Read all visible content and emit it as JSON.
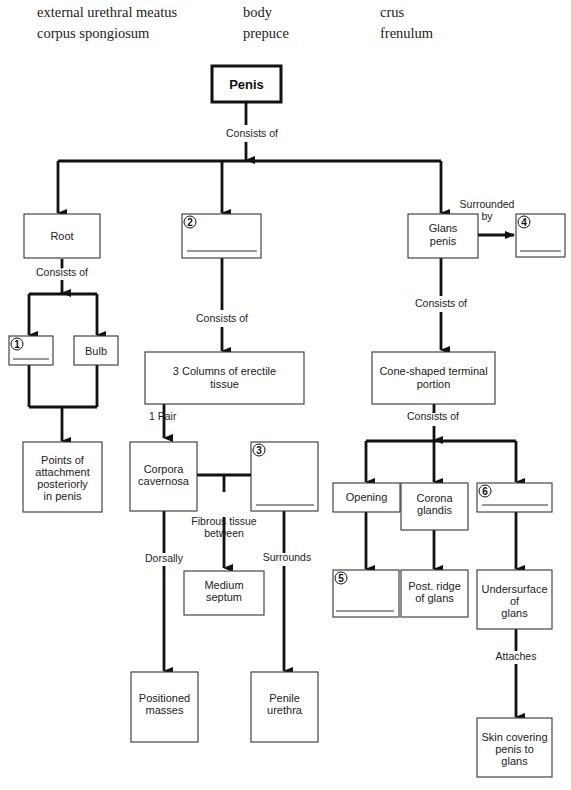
{
  "word_bank": [
    {
      "text": "external urethral meatus",
      "x": 37,
      "y": 6
    },
    {
      "text": "body",
      "x": 243,
      "y": 6
    },
    {
      "text": "crus",
      "x": 380,
      "y": 6
    },
    {
      "text": "corpus spongiosum",
      "x": 37,
      "y": 28
    },
    {
      "text": "prepuce",
      "x": 243,
      "y": 28
    },
    {
      "text": "frenulum",
      "x": 380,
      "y": 28
    }
  ],
  "diagram": {
    "title": "Penis",
    "nodes": {
      "root": "Root",
      "blank2": "",
      "glans": [
        "Glans",
        "penis"
      ],
      "blank4": "",
      "blank1": "",
      "bulb": "Bulb",
      "attachment": [
        "Points of",
        "attachment",
        "posteriorly",
        "in penis"
      ],
      "columns": [
        "3 Columns of erectile",
        "tissue"
      ],
      "cone": [
        "Cone-shaped terminal",
        "portion"
      ],
      "corpora": [
        "Corpora",
        "cavernosa"
      ],
      "blank3": "",
      "septum": [
        "Medium",
        "septum"
      ],
      "positioned": [
        "Positioned",
        "masses"
      ],
      "urethra": [
        "Penile",
        "urethra"
      ],
      "opening": "Opening",
      "corona": [
        "Corona",
        "glandis"
      ],
      "blank6": "",
      "blank5": "",
      "postridge": [
        "Post. ridge",
        "of glans"
      ],
      "undersurface": [
        "Undersurface",
        "of",
        "glans"
      ],
      "skin": [
        "Skin covering",
        "penis to",
        "glans"
      ]
    },
    "numbers": [
      "1",
      "2",
      "3",
      "4",
      "5",
      "6"
    ],
    "edge_labels": {
      "penis_consists": "Consists of",
      "root_consists": "Consists of",
      "body_consists": "Consists of",
      "glans_surrounded": [
        "Surrounded",
        "by"
      ],
      "glans_consists": "Consists of",
      "cone_consists": "Consists of",
      "one_pair": "1 Pair",
      "fibrous": [
        "Fibrous tissue",
        "between"
      ],
      "dorsally": "Dorsally",
      "surrounds": "Surrounds",
      "attaches": "Attaches"
    }
  }
}
